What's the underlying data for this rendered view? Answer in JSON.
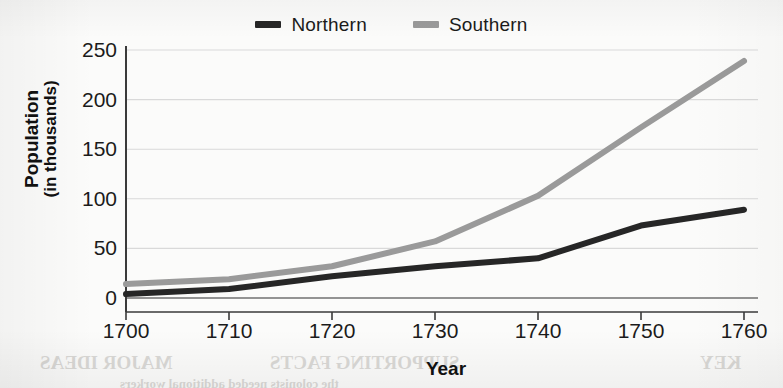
{
  "chart_data": {
    "type": "line",
    "title": "",
    "xlabel": "Year",
    "ylabel": "Population",
    "ylabel_sub": "(in thousands)",
    "x": [
      1700,
      1710,
      1720,
      1730,
      1740,
      1750,
      1760
    ],
    "xticklabels": [
      "1700",
      "1710",
      "1720",
      "1730",
      "1740",
      "1750",
      "1760"
    ],
    "yticks": [
      0,
      50,
      100,
      150,
      200,
      250
    ],
    "yticklabels": [
      "0",
      "50",
      "100",
      "150",
      "200",
      "250"
    ],
    "ylim": [
      0,
      262
    ],
    "xlim": [
      1700,
      1760
    ],
    "grid": "horizontal",
    "legend_position": "top-center",
    "series": [
      {
        "name": "Northern",
        "color": "#262626",
        "values": [
          4,
          9,
          22,
          32,
          40,
          73,
          89
        ]
      },
      {
        "name": "Southern",
        "color": "#9a9a9a",
        "values": [
          14,
          19,
          32,
          57,
          103,
          172,
          239
        ]
      }
    ]
  },
  "legend": {
    "items": [
      {
        "label": "Northern",
        "color": "#262626"
      },
      {
        "label": "Southern",
        "color": "#9a9a9a"
      }
    ]
  },
  "axes": {
    "y_title_line1": "Population",
    "y_title_line2": "(in thousands)",
    "x_title": "Year"
  },
  "bleed_through": {
    "items": [
      {
        "text": "MAJOR IDEAS",
        "left": 40,
        "top": 6,
        "size": 19
      },
      {
        "text": "SUPPORTING FACTS",
        "left": 270,
        "top": 6,
        "size": 19
      },
      {
        "text": "KEY",
        "left": 700,
        "top": 6,
        "size": 19
      },
      {
        "text": "the colonists needed additional workers",
        "left": 120,
        "top": 30,
        "size": 13
      }
    ]
  },
  "colors": {
    "background": "#fbfbfa",
    "axis": "#3a3a3a",
    "grid": "#d9d9d9",
    "text": "#1b1b1b"
  }
}
